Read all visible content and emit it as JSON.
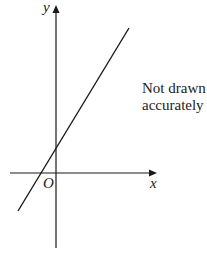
{
  "diagram": {
    "type": "coordinate-axes-with-straight-line",
    "axes": {
      "x_label": "x",
      "y_label": "y",
      "origin_label": "O"
    },
    "line": {
      "description": "straight line with positive gradient and positive y-intercept, crossing the x-axis at a negative value"
    },
    "note": {
      "line1": "Not drawn",
      "line2": "accurately"
    },
    "colors": {
      "stroke": "#1a1a1a",
      "background": "#ffffff"
    }
  }
}
